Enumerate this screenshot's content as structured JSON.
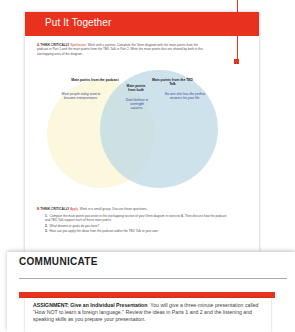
{
  "page": {
    "section_title": "Put It Together",
    "exercise_a": {
      "letter": "A",
      "label": "THINK CRITICALLY",
      "skill": "Synthesize.",
      "instructions": "Work with a partner. Complete the Venn diagram with the main points from the podcast in Part 1 and the main points from the TED Talk in Part 2. Write the main points that are shared by both in the overlapping area of the diagram."
    },
    "venn": {
      "left_heading": "Main points from the podcast",
      "middle_heading": "Main points from both",
      "right_heading": "Main points from the TED Talk",
      "left_text": "More people today want to become entrepreneurs.",
      "middle_text": "Don't believe in overnight success.",
      "right_text": "No one else has the perfect answers for your life.",
      "colors": {
        "left": "#fbf8de",
        "right": "#bed8e6"
      }
    },
    "exercise_b": {
      "letter": "B",
      "label": "THINK CRITICALLY",
      "skill": "Apply.",
      "instructions": "Work in a small group. Discuss these questions.",
      "questions": [
        {
          "num": "1.",
          "text": "Compare the main points you wrote in the overlapping section of your Venn diagram in exercise A. Then discuss how the podcast and TED Talk support each of these main points."
        },
        {
          "num": "2.",
          "text": "What dreams or goals do you have?"
        },
        {
          "num": "3.",
          "text": "How can you apply the ideas from the podcast and/or the TED Talk to your own"
        }
      ]
    }
  },
  "communicate": {
    "title": "COMMUNICATE",
    "assignment_label": "ASSIGNMENT: Give an Individual Presentation",
    "assignment_text": "You will give a three-minute presentation called \"How NOT to learn a foreign language.\" Review the ideas in Parts 1 and 2 and the listening and speaking skills as you prepare your presentation."
  },
  "colors": {
    "accent": "#e8321e"
  }
}
